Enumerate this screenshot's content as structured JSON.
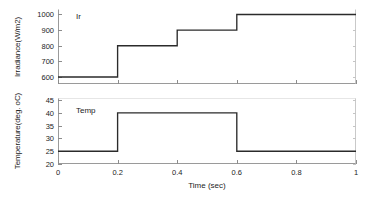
{
  "figure": {
    "background": "#ffffff",
    "trace_color": "#2b2b2b",
    "axis_color": "#9a9a9a"
  },
  "xaxis": {
    "label": "Time (sec)",
    "ticks": [
      "0",
      "0.2",
      "0.4",
      "0.6",
      "0.8",
      "1"
    ],
    "tick_values": [
      0,
      0.2,
      0.4,
      0.6,
      0.8,
      1
    ],
    "min": 0,
    "max": 1
  },
  "subplots": [
    {
      "name": "irradiance",
      "annotation": "Ir",
      "ylabel": "Irradiance(W/m2)",
      "yticks": [
        "600",
        "700",
        "800",
        "900",
        "1000"
      ],
      "ytick_values": [
        600,
        700,
        800,
        900,
        1000
      ],
      "ymin": 555,
      "ymax": 1035
    },
    {
      "name": "temperature",
      "annotation": "Temp",
      "ylabel": "Temperature(deg. oC)",
      "yticks": [
        "20",
        "25",
        "30",
        "35",
        "40",
        "45"
      ],
      "ytick_values": [
        20,
        25,
        30,
        35,
        40,
        45
      ],
      "ymin": 20,
      "ymax": 45.8
    }
  ],
  "chart_data": [
    {
      "type": "line",
      "name": "Ir",
      "title": "",
      "xlabel": "Time (sec)",
      "ylabel": "Irradiance(W/m2)",
      "xlim": [
        0,
        1
      ],
      "ylim": [
        555,
        1035
      ],
      "grid": false,
      "legend": "none",
      "annotation": "Ir",
      "step": "post",
      "x": [
        0,
        0.2,
        0.2,
        0.4,
        0.4,
        0.6,
        0.6,
        1
      ],
      "y": [
        600,
        600,
        800,
        800,
        900,
        900,
        1000,
        1000
      ],
      "segments": [
        {
          "from_t": 0.0,
          "to_t": 0.2,
          "value": 600
        },
        {
          "from_t": 0.2,
          "to_t": 0.4,
          "value": 800
        },
        {
          "from_t": 0.4,
          "to_t": 0.6,
          "value": 900
        },
        {
          "from_t": 0.6,
          "to_t": 1.0,
          "value": 1000
        }
      ]
    },
    {
      "type": "line",
      "name": "Temp",
      "title": "",
      "xlabel": "Time (sec)",
      "ylabel": "Temperature(deg. oC)",
      "xlim": [
        0,
        1
      ],
      "ylim": [
        20,
        45.8
      ],
      "grid": false,
      "legend": "none",
      "annotation": "Temp",
      "step": "post",
      "x": [
        0,
        0.2,
        0.2,
        0.6,
        0.6,
        1
      ],
      "y": [
        25,
        25,
        40,
        40,
        25,
        25
      ],
      "segments": [
        {
          "from_t": 0.0,
          "to_t": 0.2,
          "value": 25
        },
        {
          "from_t": 0.2,
          "to_t": 0.6,
          "value": 40
        },
        {
          "from_t": 0.6,
          "to_t": 1.0,
          "value": 25
        }
      ]
    }
  ]
}
